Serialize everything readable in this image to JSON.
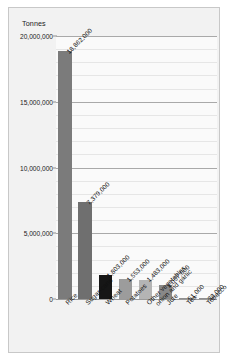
{
  "chart_data": {
    "type": "bar",
    "title": "",
    "ylabel": "Tonnes",
    "xlabel": "",
    "ylim": [
      0,
      20000000
    ],
    "ytick_labels": [
      "0",
      "5,000,000",
      "10,000,000",
      "15,000,000",
      "20,000,000"
    ],
    "ytick_values": [
      0,
      5000000,
      10000000,
      15000000,
      20000000
    ],
    "grid": "horizontal-major-and-minor",
    "minor_divisions_per_major": 5,
    "legend": "none",
    "categories": [
      "Rice",
      "Sugar-cane",
      "Wheat",
      "Potatoes",
      "Other vegetables, onion and garlic",
      "Jute",
      "Tea",
      "Tobacco"
    ],
    "category_label_lines": [
      [
        "Rice"
      ],
      [
        "Sugar-cane"
      ],
      [
        "Wheat"
      ],
      [
        "Potatoes"
      ],
      [
        "Other vegetables,",
        "onion and garlic"
      ],
      [
        "Jute"
      ],
      [
        "Tea"
      ],
      [
        "Tobacco"
      ]
    ],
    "values": [
      18862000,
      7379000,
      1803000,
      1553000,
      1483000,
      1057000,
      51000,
      33000
    ],
    "value_labels": [
      "18,862,000",
      "7,379,000",
      "1,803,000",
      "1,553,000",
      "1,483,000",
      "1,057,000",
      "51,000",
      "33,000"
    ],
    "bar_colors": [
      "#7b7b7b",
      "#6f6f6f",
      "#161616",
      "#9c9c9c",
      "#b4b4b4",
      "#888888",
      "#8f8f8f",
      "#8f8f8f"
    ]
  },
  "colors": {
    "page_background": "#ffffff",
    "frame_background": "#f2f2f2",
    "frame_border": "#c8c8c8",
    "plot_background": "#fafafa",
    "gridline_minor": "#e6e6e6",
    "gridline_major": "#a9a9a9",
    "text": "#111111"
  }
}
